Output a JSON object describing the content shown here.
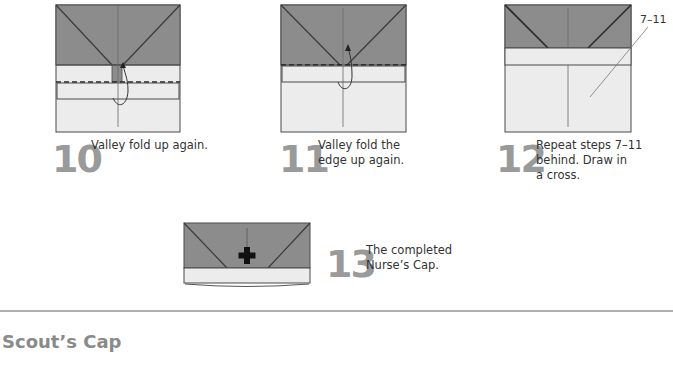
{
  "colors": {
    "paper_dark": "#8c8c8c",
    "paper_light": "#ececec",
    "line": "#4a4a4a",
    "step_number": "#9a9a9a",
    "section_title": "#8a8a8a",
    "divider": "#b0b0b0"
  },
  "steps": [
    {
      "number": "10",
      "text": "Valley fold up again."
    },
    {
      "number": "11",
      "text": "Valley fold the\nedge up again."
    },
    {
      "number": "12",
      "text": "Repeat steps 7–11\nbehind. Draw in\na cross.",
      "reference_label": "7–11"
    },
    {
      "number": "13",
      "text": "The completed\nNurse’s Cap."
    }
  ],
  "section": {
    "title": "Scout’s Cap"
  }
}
